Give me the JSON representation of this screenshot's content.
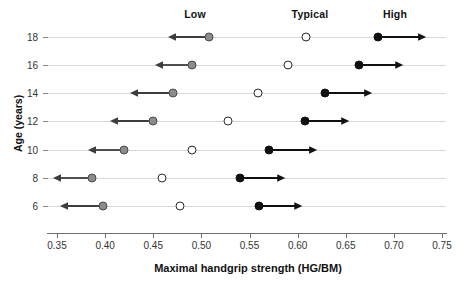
{
  "chart_data": {
    "type": "scatter",
    "title": "",
    "xlabel": "Maximal handgrip strength (HG/BM)",
    "ylabel": "Age (years)",
    "xlim": [
      0.35,
      0.75
    ],
    "xticks": [
      "0.35",
      "0.40",
      "0.45",
      "0.50",
      "0.55",
      "0.60",
      "0.65",
      "0.70",
      "0.75"
    ],
    "xtick_values": [
      0.35,
      0.4,
      0.45,
      0.5,
      0.55,
      0.6,
      0.65,
      0.7,
      0.75
    ],
    "categories": [
      "18",
      "16",
      "14",
      "12",
      "10",
      "8",
      "6"
    ],
    "ytick_values": [
      18,
      16,
      14,
      12,
      10,
      8,
      6
    ],
    "grid": "horizontal-row-lines",
    "legend_position": "top-inline-column-headers",
    "column_headers": [
      "Low",
      "Typical",
      "High"
    ],
    "series": [
      {
        "name": "Low",
        "marker": "filled-gray-circle",
        "color": "#8c8c8c",
        "arrow_direction": "left",
        "values": [
          0.508,
          0.49,
          0.47,
          0.45,
          0.42,
          0.386,
          0.398
        ],
        "arrow_end_values": [
          0.465,
          0.452,
          0.426,
          0.405,
          0.382,
          0.346,
          0.353
        ]
      },
      {
        "name": "Typical",
        "marker": "open-circle",
        "color": "#ffffff",
        "arrow_direction": "none",
        "values": [
          0.609,
          0.59,
          0.559,
          0.528,
          0.49,
          0.459,
          0.478
        ],
        "arrow_end_values": [
          null,
          null,
          null,
          null,
          null,
          null,
          null
        ]
      },
      {
        "name": "High",
        "marker": "filled-black-circle",
        "color": "#111111",
        "arrow_direction": "right",
        "values": [
          0.683,
          0.664,
          0.628,
          0.608,
          0.57,
          0.54,
          0.56
        ],
        "arrow_end_values": [
          0.733,
          0.71,
          0.677,
          0.654,
          0.62,
          0.587,
          0.605
        ]
      }
    ],
    "annotations": [
      {
        "label": "Low",
        "x": 0.494
      },
      {
        "label": "Typical",
        "x": 0.613
      },
      {
        "label": "High",
        "x": 0.701
      }
    ]
  },
  "colors": {
    "low_marker": "#8c8c8c",
    "typical_marker": "#ffffff",
    "high_marker": "#111111",
    "row_line": "#d8d8d8",
    "axis": "#6e6e6e",
    "text": "#1a1a1a"
  }
}
